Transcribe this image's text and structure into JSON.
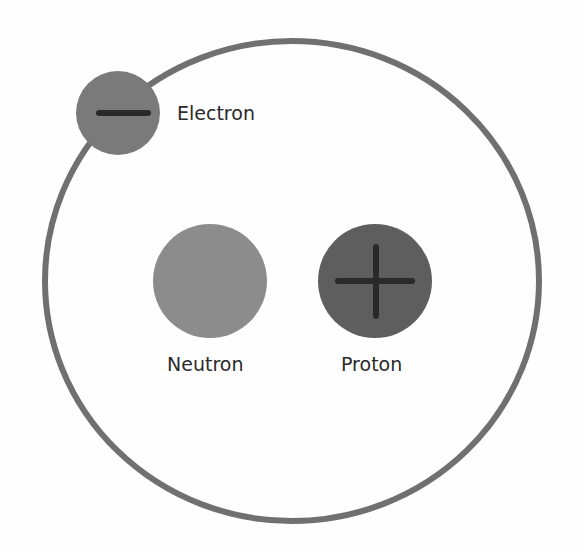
{
  "diagram": {
    "type": "atom-model",
    "colors": {
      "background": "#fefefe",
      "orbit": "#707070",
      "electron": "#7a7a7a",
      "neutron": "#8c8c8c",
      "proton": "#5e5e5e",
      "sign": "#2a2a2a",
      "text": "#2b2b2b"
    },
    "orbit": {
      "cx": 292,
      "cy": 281,
      "rx": 247,
      "ry": 240,
      "stroke_width": 6
    },
    "particles": [
      {
        "id": "electron",
        "label": "Electron",
        "charge": "negative",
        "sign_icon": "minus-icon",
        "cx": 118,
        "cy": 113,
        "r": 42
      },
      {
        "id": "neutron",
        "label": "Neutron",
        "charge": "neutral",
        "cx": 210,
        "cy": 281,
        "r": 57
      },
      {
        "id": "proton",
        "label": "Proton",
        "charge": "positive",
        "sign_icon": "plus-icon",
        "cx": 375,
        "cy": 281,
        "r": 57
      }
    ]
  }
}
